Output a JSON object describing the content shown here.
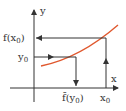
{
  "diagram": {
    "axes": {
      "x_label": "x",
      "y_label": "y"
    },
    "labels": {
      "f_x0": "f(x",
      "f_x0_sub": "0",
      "f_x0_close": ")",
      "y0": "y",
      "y0_sub": "0",
      "finv_y0": "f̄(y",
      "finv_y0_sub": "0",
      "finv_y0_close": ")",
      "x0": "x",
      "x0_sub": "0"
    },
    "colors": {
      "curve": "#e0582e",
      "axis": "#333333",
      "guide": "#333333"
    }
  }
}
